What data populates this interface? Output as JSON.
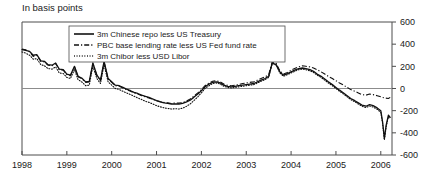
{
  "title": "In basis points",
  "chart_data": {
    "type": "line",
    "title": "In basis points",
    "xlabel": "",
    "ylabel": "",
    "ylim": [
      -600,
      600
    ],
    "xlim": [
      1998,
      2006.25
    ],
    "yticks": [
      600,
      400,
      200,
      0,
      -200,
      -400,
      -600
    ],
    "ytick_labels": [
      "600",
      "400",
      "200",
      "0",
      "-200",
      "-400",
      "-600"
    ],
    "xticks": [
      1998,
      1999,
      2000,
      2001,
      2002,
      2003,
      2004,
      2005,
      2006
    ],
    "xtick_labels": [
      "1998",
      "1999",
      "2000",
      "2001",
      "2002",
      "2003",
      "2004",
      "2005",
      "2006"
    ],
    "grid": false,
    "zero_line": true,
    "legend_position": "top-left-inside",
    "series": [
      {
        "name": "3m Chinese repo less US Treasury",
        "style": "solid",
        "x": [
          1998.0,
          1998.08,
          1998.17,
          1998.25,
          1998.33,
          1998.42,
          1998.5,
          1998.58,
          1998.67,
          1998.75,
          1998.83,
          1998.92,
          1999.0,
          1999.08,
          1999.17,
          1999.25,
          1999.33,
          1999.42,
          1999.5,
          1999.58,
          1999.67,
          1999.75,
          1999.83,
          1999.92,
          2000.0,
          2000.08,
          2000.17,
          2000.25,
          2000.33,
          2000.42,
          2000.5,
          2000.58,
          2000.67,
          2000.75,
          2000.83,
          2000.92,
          2001.0,
          2001.08,
          2001.17,
          2001.25,
          2001.33,
          2001.42,
          2001.5,
          2001.58,
          2001.67,
          2001.75,
          2001.83,
          2001.92,
          2002.0,
          2002.08,
          2002.17,
          2002.25,
          2002.33,
          2002.42,
          2002.5,
          2002.58,
          2002.67,
          2002.75,
          2002.83,
          2002.92,
          2003.0,
          2003.08,
          2003.17,
          2003.25,
          2003.33,
          2003.42,
          2003.5,
          2003.58,
          2003.67,
          2003.75,
          2003.83,
          2003.92,
          2004.0,
          2004.08,
          2004.17,
          2004.25,
          2004.33,
          2004.42,
          2004.5,
          2004.58,
          2004.67,
          2004.75,
          2004.83,
          2004.92,
          2005.0,
          2005.08,
          2005.17,
          2005.25,
          2005.33,
          2005.42,
          2005.5,
          2005.58,
          2005.67,
          2005.75,
          2005.83,
          2005.92,
          2006.0,
          2006.04,
          2006.08,
          2006.12,
          2006.17,
          2006.21
        ],
        "values": [
          350,
          345,
          335,
          300,
          305,
          250,
          245,
          215,
          210,
          230,
          175,
          170,
          130,
          120,
          200,
          110,
          95,
          60,
          65,
          230,
          120,
          75,
          245,
          90,
          60,
          30,
          25,
          10,
          -5,
          -20,
          -35,
          -45,
          -60,
          -70,
          -80,
          -95,
          -110,
          -120,
          -130,
          -135,
          -140,
          -138,
          -140,
          -135,
          -120,
          -105,
          -80,
          -50,
          -20,
          15,
          40,
          55,
          60,
          50,
          30,
          20,
          15,
          20,
          25,
          30,
          35,
          40,
          45,
          60,
          75,
          90,
          110,
          230,
          215,
          150,
          120,
          135,
          150,
          165,
          180,
          185,
          180,
          170,
          155,
          130,
          110,
          85,
          60,
          35,
          10,
          -15,
          -40,
          -65,
          -90,
          -110,
          -130,
          -150,
          -160,
          -145,
          -155,
          -175,
          -200,
          -300,
          -450,
          -330,
          -240,
          -260
        ]
      },
      {
        "name": "PBC base lending rate less US Fed fund rate",
        "style": "dash-dot",
        "x": [
          1998.0,
          1998.08,
          1998.17,
          1998.25,
          1998.33,
          1998.42,
          1998.5,
          1998.58,
          1998.67,
          1998.75,
          1998.83,
          1998.92,
          1999.0,
          1999.08,
          1999.17,
          1999.25,
          1999.33,
          1999.42,
          1999.5,
          1999.58,
          1999.67,
          1999.75,
          1999.83,
          1999.92,
          2000.0,
          2000.08,
          2000.17,
          2000.25,
          2000.33,
          2000.42,
          2000.5,
          2000.58,
          2000.67,
          2000.75,
          2000.83,
          2000.92,
          2001.0,
          2001.08,
          2001.17,
          2001.25,
          2001.33,
          2001.42,
          2001.5,
          2001.58,
          2001.67,
          2001.75,
          2001.83,
          2001.92,
          2002.0,
          2002.08,
          2002.17,
          2002.25,
          2002.33,
          2002.42,
          2002.5,
          2002.58,
          2002.67,
          2002.75,
          2002.83,
          2002.92,
          2003.0,
          2003.08,
          2003.17,
          2003.25,
          2003.33,
          2003.42,
          2003.5,
          2003.58,
          2003.67,
          2003.75,
          2003.83,
          2003.92,
          2004.0,
          2004.08,
          2004.17,
          2004.25,
          2004.33,
          2004.42,
          2004.5,
          2004.58,
          2004.67,
          2004.75,
          2004.83,
          2004.92,
          2005.0,
          2005.08,
          2005.17,
          2005.25,
          2005.33,
          2005.42,
          2005.5,
          2005.58,
          2005.67,
          2005.75,
          2005.83,
          2005.92,
          2006.0,
          2006.08,
          2006.17,
          2006.21
        ],
        "values": [
          355,
          350,
          330,
          290,
          300,
          245,
          240,
          210,
          205,
          225,
          170,
          165,
          125,
          115,
          195,
          105,
          90,
          55,
          60,
          225,
          115,
          70,
          240,
          85,
          55,
          25,
          20,
          5,
          -10,
          -25,
          -40,
          -50,
          -65,
          -75,
          -85,
          -100,
          -110,
          -118,
          -125,
          -130,
          -135,
          -130,
          -132,
          -128,
          -112,
          -95,
          -70,
          -40,
          -10,
          25,
          50,
          65,
          70,
          60,
          40,
          30,
          25,
          30,
          35,
          45,
          50,
          55,
          60,
          75,
          90,
          105,
          125,
          240,
          225,
          160,
          130,
          145,
          165,
          180,
          195,
          205,
          200,
          195,
          185,
          170,
          150,
          130,
          110,
          90,
          70,
          50,
          30,
          10,
          -10,
          -25,
          -40,
          -55,
          -60,
          -50,
          -55,
          -65,
          -75,
          -85,
          -90,
          -80
        ]
      },
      {
        "name": "3m Chibor less USD Libor",
        "style": "dotted",
        "x": [
          1998.0,
          1998.08,
          1998.17,
          1998.25,
          1998.33,
          1998.42,
          1998.5,
          1998.58,
          1998.67,
          1998.75,
          1998.83,
          1998.92,
          1999.0,
          1999.08,
          1999.17,
          1999.25,
          1999.33,
          1999.42,
          1999.5,
          1999.58,
          1999.67,
          1999.75,
          1999.83,
          1999.92,
          2000.0,
          2000.08,
          2000.17,
          2000.25,
          2000.33,
          2000.42,
          2000.5,
          2000.58,
          2000.67,
          2000.75,
          2000.83,
          2000.92,
          2001.0,
          2001.08,
          2001.17,
          2001.25,
          2001.33,
          2001.42,
          2001.5,
          2001.58,
          2001.67,
          2001.75,
          2001.83,
          2001.92,
          2002.0,
          2002.08,
          2002.17,
          2002.25,
          2002.33,
          2002.42,
          2002.5,
          2002.58,
          2002.67,
          2002.75,
          2002.83,
          2002.92,
          2003.0,
          2003.08,
          2003.17,
          2003.25,
          2003.33,
          2003.42,
          2003.5,
          2003.58,
          2003.67,
          2003.75,
          2003.83,
          2003.92,
          2004.0,
          2004.08,
          2004.17,
          2004.25,
          2004.33,
          2004.42,
          2004.5,
          2004.58,
          2004.67,
          2004.75,
          2004.83,
          2004.92,
          2005.0,
          2005.08,
          2005.17,
          2005.25,
          2005.33,
          2005.42,
          2005.5,
          2005.58,
          2005.67,
          2005.75,
          2005.83,
          2005.92,
          2006.0,
          2006.04,
          2006.08,
          2006.12,
          2006.17,
          2006.21
        ],
        "values": [
          330,
          320,
          300,
          265,
          270,
          215,
          205,
          180,
          175,
          195,
          140,
          135,
          100,
          90,
          170,
          80,
          60,
          25,
          30,
          200,
          90,
          45,
          215,
          60,
          30,
          0,
          -10,
          -25,
          -40,
          -55,
          -70,
          -85,
          -100,
          -115,
          -125,
          -140,
          -155,
          -165,
          -175,
          -180,
          -185,
          -182,
          -185,
          -178,
          -160,
          -140,
          -110,
          -75,
          -40,
          0,
          25,
          45,
          50,
          40,
          20,
          10,
          5,
          10,
          15,
          20,
          25,
          30,
          35,
          50,
          65,
          80,
          100,
          225,
          210,
          140,
          110,
          125,
          140,
          155,
          170,
          175,
          170,
          160,
          145,
          120,
          100,
          75,
          50,
          25,
          0,
          -25,
          -50,
          -75,
          -100,
          -120,
          -140,
          -160,
          -172,
          -158,
          -168,
          -188,
          -215,
          -315,
          -465,
          -345,
          -255,
          -275
        ]
      }
    ]
  },
  "legend": {
    "items": [
      {
        "label": "3m Chinese repo less US Treasury",
        "style": "solid"
      },
      {
        "label": "PBC base lending rate less US Fed fund rate",
        "style": "dash-dot"
      },
      {
        "label": "3m Chibor less USD Libor",
        "style": "dotted"
      }
    ]
  }
}
